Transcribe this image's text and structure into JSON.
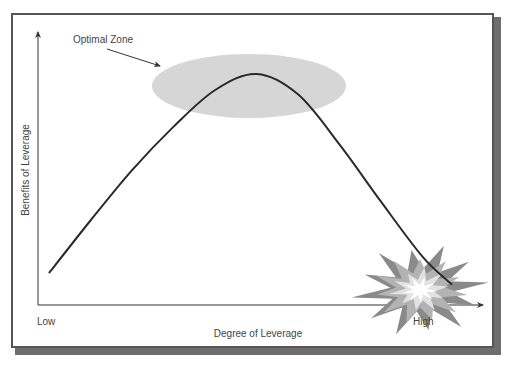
{
  "chart_data": {
    "type": "line",
    "title": "",
    "xlabel": "Degree of Leverage",
    "ylabel": "Benefits of Leverage",
    "x_tick_labels": [
      "Low",
      "High"
    ],
    "annotations": [
      {
        "text": "Optimal Zone",
        "target": "peak of curve (shaded ellipse)"
      },
      {
        "text": "",
        "icon": "explosion",
        "target": "end of curve at high leverage"
      }
    ],
    "series": [
      {
        "name": "Benefits of Leverage",
        "shape": "inverted-U",
        "x": [
          0.0,
          0.1,
          0.2,
          0.3,
          0.4,
          0.5,
          0.6,
          0.7,
          0.8,
          0.9,
          0.97
        ],
        "y": [
          0.1,
          0.33,
          0.55,
          0.74,
          0.9,
          0.97,
          0.88,
          0.66,
          0.41,
          0.17,
          0.05
        ]
      }
    ],
    "xlim": [
      0,
      1
    ],
    "ylim": [
      0,
      1
    ],
    "grid": false,
    "legend": "none"
  },
  "colors": {
    "curve": "#2a2a2a",
    "zone": "#d6d6d6",
    "explosion_outer": "#8a8a8a",
    "explosion_mid": "#b3b3b3",
    "explosion_inner": "#e2e2e2",
    "explosion_core": "#ffffff"
  }
}
